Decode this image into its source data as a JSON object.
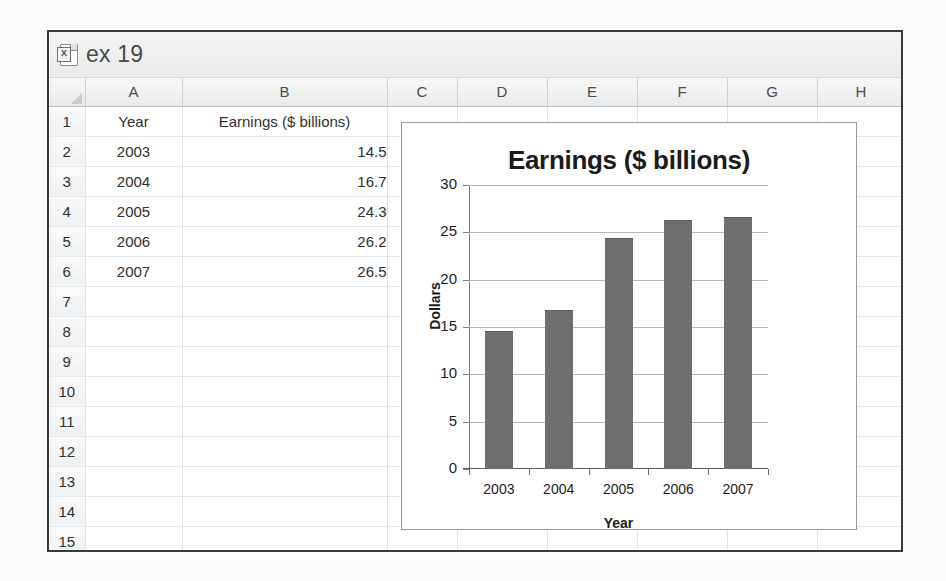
{
  "window": {
    "title": "ex 19",
    "icon": "excel-document-icon",
    "icon_badge": "X"
  },
  "sheet": {
    "column_headers": [
      "A",
      "B",
      "C",
      "D",
      "E",
      "F",
      "G",
      "H"
    ],
    "row_headers": [
      "1",
      "2",
      "3",
      "4",
      "5",
      "6",
      "7",
      "8",
      "9",
      "10",
      "11",
      "12",
      "13",
      "14",
      "15"
    ],
    "rows": [
      {
        "num": "1",
        "a": "Year",
        "b": "Earnings ($ billions)"
      },
      {
        "num": "2",
        "a": "2003",
        "b": "14.5"
      },
      {
        "num": "3",
        "a": "2004",
        "b": "16.7"
      },
      {
        "num": "4",
        "a": "2005",
        "b": "24.3"
      },
      {
        "num": "5",
        "a": "2006",
        "b": "26.2"
      },
      {
        "num": "6",
        "a": "2007",
        "b": "26.5"
      },
      {
        "num": "7",
        "a": "",
        "b": ""
      },
      {
        "num": "8",
        "a": "",
        "b": ""
      },
      {
        "num": "9",
        "a": "",
        "b": ""
      },
      {
        "num": "10",
        "a": "",
        "b": ""
      },
      {
        "num": "11",
        "a": "",
        "b": ""
      },
      {
        "num": "12",
        "a": "",
        "b": ""
      },
      {
        "num": "13",
        "a": "",
        "b": ""
      },
      {
        "num": "14",
        "a": "",
        "b": ""
      },
      {
        "num": "15",
        "a": "",
        "b": ""
      }
    ]
  },
  "chart_data": {
    "type": "bar",
    "title": "Earnings ($ billions)",
    "categories": [
      "2003",
      "2004",
      "2005",
      "2006",
      "2007"
    ],
    "values": [
      14.5,
      16.7,
      24.3,
      26.2,
      26.5
    ],
    "xlabel": "Year",
    "ylabel": "Dollars",
    "ylim": [
      0,
      30
    ],
    "yticks": [
      0,
      5,
      10,
      15,
      20,
      25,
      30
    ],
    "ytick_labels": [
      "0",
      "5",
      "10",
      "15",
      "20",
      "25",
      "30"
    ],
    "grid": true,
    "legend": false,
    "series_color": "#6e6e6e"
  }
}
